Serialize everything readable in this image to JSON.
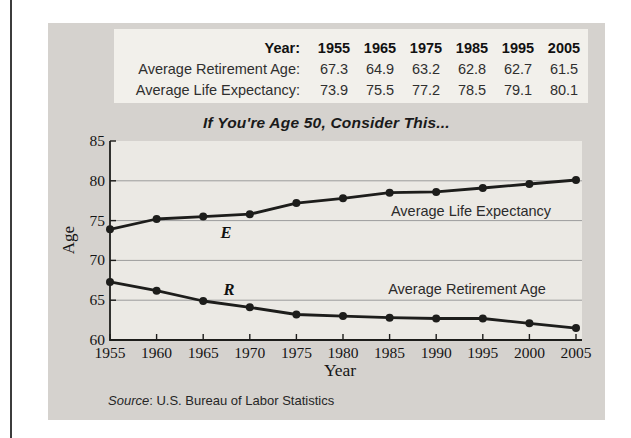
{
  "colors": {
    "page_bg": "#ffffff",
    "edge_line": "#3c3c3c",
    "panel_bg": "#d5d2ce",
    "table_bg": "#f2f0eb",
    "plot_bg": "#ebe9e4",
    "grid_line": "#9c9c9c",
    "series_line": "#1d1d1b",
    "text": "#222222"
  },
  "table": {
    "header_label": "Year:",
    "years": [
      "1955",
      "1965",
      "1975",
      "1985",
      "1995",
      "2005"
    ],
    "rows": [
      {
        "label": "Average Retirement Age:",
        "values": [
          "67.3",
          "64.9",
          "63.2",
          "62.8",
          "62.7",
          "61.5"
        ]
      },
      {
        "label": "Average Life Expectancy:",
        "values": [
          "73.9",
          "75.5",
          "77.2",
          "78.5",
          "79.1",
          "80.1"
        ]
      }
    ]
  },
  "chart_data": {
    "type": "line",
    "title": "If You're Age 50, Consider This...",
    "xlabel": "Year",
    "ylabel": "Age",
    "x": [
      1955,
      1960,
      1965,
      1970,
      1975,
      1980,
      1985,
      1990,
      1995,
      2000,
      2005
    ],
    "series": [
      {
        "name": "Average Life Expectancy",
        "letter": "E",
        "values": [
          73.9,
          75.2,
          75.5,
          75.8,
          77.2,
          77.8,
          78.5,
          78.6,
          79.1,
          79.6,
          80.1
        ]
      },
      {
        "name": "Average Retirement Age",
        "letter": "R",
        "values": [
          67.3,
          66.2,
          64.9,
          64.1,
          63.2,
          63.0,
          62.8,
          62.7,
          62.7,
          62.1,
          61.5
        ]
      }
    ],
    "ylim": [
      60,
      85
    ],
    "yticks": [
      60,
      65,
      70,
      75,
      80,
      85
    ],
    "xticks": [
      1955,
      1960,
      1965,
      1970,
      1975,
      1980,
      1985,
      1990,
      1995,
      2000,
      2005
    ],
    "grid": "horizontal",
    "legend_position": "inline labels inside plot"
  },
  "source": {
    "italic": "Source",
    "rest": ": U.S. Bureau of Labor Statistics"
  }
}
